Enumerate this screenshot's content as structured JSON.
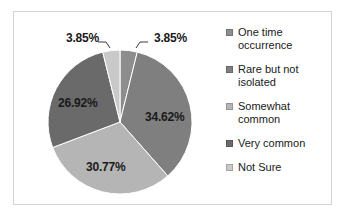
{
  "chart_data": {
    "type": "pie",
    "title": "",
    "xlabel": "",
    "ylabel": "",
    "grid": false,
    "legend_position": "right",
    "categories": [
      "One time occurrence",
      "Rare but not isolated",
      "Somewhat common",
      "Very common",
      "Not Sure"
    ],
    "values": [
      3.85,
      34.62,
      30.77,
      26.92,
      3.85
    ],
    "labels": [
      "3.85%",
      "34.62%",
      "30.77%",
      "26.92%",
      "3.85%"
    ],
    "colors": [
      "#8d8d8d",
      "#7f7f7f",
      "#b5b5b5",
      "#6a6a6a",
      "#c9c9c9"
    ],
    "start_angle_deg": 0,
    "direction": "clockwise",
    "units": "percent"
  },
  "legend": {
    "items": [
      {
        "label": "One time occurrence",
        "color": "#8d8d8d"
      },
      {
        "label": "Rare but not isolated",
        "color": "#7f7f7f"
      },
      {
        "label": "Somewhat common",
        "color": "#b5b5b5"
      },
      {
        "label": "Very common",
        "color": "#6a6a6a"
      },
      {
        "label": "Not Sure",
        "color": "#c9c9c9"
      }
    ]
  },
  "frame": {
    "border_color": "#d4d4d4",
    "background": "#ffffff"
  }
}
